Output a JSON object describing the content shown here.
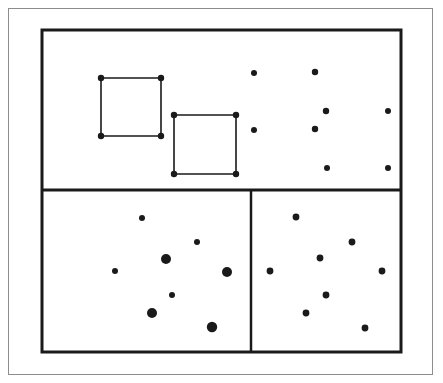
{
  "figure": {
    "canvas": {
      "width": 443,
      "height": 383,
      "background": "#ffffff"
    },
    "colors": {
      "ink": "#1a1a1a",
      "outer_frame": "#8d8d8d",
      "background": "#ffffff"
    },
    "outer_frame": {
      "label": "outer page border",
      "x": 8.5,
      "y": 8.5,
      "width": 424,
      "height": 366,
      "stroke_width": 1,
      "color": "#8d8d8d"
    },
    "main_region": {
      "label": "main bounding rectangle",
      "x": 42,
      "y": 30,
      "width": 359,
      "height": 322,
      "stroke_width": 3,
      "color": "#1a1a1a"
    },
    "dividers": [
      {
        "name": "horizontal-divider",
        "orientation": "horizontal",
        "x1": 42,
        "y1": 190,
        "x2": 401,
        "y2": 190,
        "stroke_width": 3
      },
      {
        "name": "vertical-divider",
        "orientation": "vertical",
        "x1": 251,
        "y1": 190,
        "x2": 251,
        "y2": 352,
        "stroke_width": 2.5
      }
    ],
    "subregions": [
      {
        "name": "top-region",
        "x": 42,
        "y": 30,
        "width": 359,
        "height": 160
      },
      {
        "name": "bottom-left-region",
        "x": 42,
        "y": 190,
        "width": 209,
        "height": 162
      },
      {
        "name": "bottom-right-region",
        "x": 251,
        "y": 190,
        "width": 150,
        "height": 162
      }
    ],
    "polygons": [
      {
        "name": "square-1",
        "stroke_width": 1.6,
        "vertex_radius": 3.2,
        "vertices": [
          {
            "x": 101,
            "y": 78
          },
          {
            "x": 161,
            "y": 78
          },
          {
            "x": 161,
            "y": 136
          },
          {
            "x": 101,
            "y": 136
          }
        ]
      },
      {
        "name": "square-2",
        "stroke_width": 1.6,
        "vertex_radius": 3.2,
        "vertices": [
          {
            "x": 174,
            "y": 115
          },
          {
            "x": 236,
            "y": 115
          },
          {
            "x": 236,
            "y": 174
          },
          {
            "x": 174,
            "y": 174
          }
        ]
      }
    ],
    "points": {
      "top_region": [
        {
          "x": 254,
          "y": 73,
          "r": 3.0
        },
        {
          "x": 315,
          "y": 72,
          "r": 3.2
        },
        {
          "x": 326,
          "y": 111,
          "r": 3.2
        },
        {
          "x": 388,
          "y": 111,
          "r": 3.0
        },
        {
          "x": 254,
          "y": 130,
          "r": 3.0
        },
        {
          "x": 315,
          "y": 129,
          "r": 3.2
        },
        {
          "x": 327,
          "y": 168,
          "r": 3.0
        },
        {
          "x": 388,
          "y": 168,
          "r": 3.0
        }
      ],
      "bottom_left_region": [
        {
          "x": 142,
          "y": 218,
          "r": 3.0
        },
        {
          "x": 197,
          "y": 242,
          "r": 3.0
        },
        {
          "x": 166,
          "y": 259,
          "r": 5.0
        },
        {
          "x": 115,
          "y": 271,
          "r": 3.0
        },
        {
          "x": 227,
          "y": 272,
          "r": 5.0
        },
        {
          "x": 172,
          "y": 295,
          "r": 3.0
        },
        {
          "x": 152,
          "y": 313,
          "r": 5.0
        },
        {
          "x": 212,
          "y": 327,
          "r": 5.2
        }
      ],
      "bottom_right_region": [
        {
          "x": 296,
          "y": 217,
          "r": 3.4
        },
        {
          "x": 352,
          "y": 242,
          "r": 3.4
        },
        {
          "x": 320,
          "y": 258,
          "r": 3.4
        },
        {
          "x": 270,
          "y": 271,
          "r": 3.4
        },
        {
          "x": 382,
          "y": 271,
          "r": 3.4
        },
        {
          "x": 326,
          "y": 295,
          "r": 3.4
        },
        {
          "x": 306,
          "y": 313,
          "r": 3.4
        },
        {
          "x": 365,
          "y": 328,
          "r": 3.4
        }
      ]
    }
  }
}
